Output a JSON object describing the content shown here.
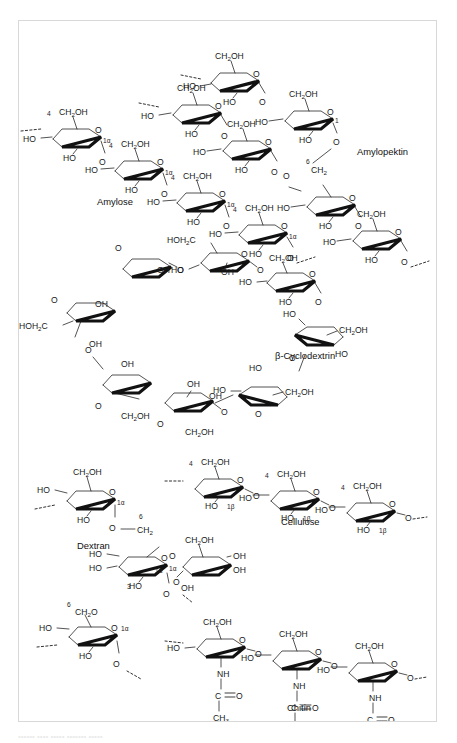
{
  "figure": {
    "background_color": "#ffffff",
    "border_color": "#d8d8d8",
    "ink_color": "#1a1a1a"
  },
  "structures": [
    {
      "id": "amylopektin",
      "name": "Amylopektin",
      "linkage_labels": [
        "6",
        "1"
      ],
      "branch_group": "CH2",
      "repeat_groups": [
        "CH2OH",
        "HO",
        "HO",
        "O"
      ]
    },
    {
      "id": "amylose",
      "name": "Amylose",
      "linkage_labels": [
        "4",
        "1α"
      ],
      "repeat_groups": [
        "CH2OH",
        "HO",
        "HO",
        "O"
      ]
    },
    {
      "id": "beta-cyclodextrin",
      "name": "β-Cyclodextrin",
      "ring_units": 7,
      "repeat_groups": [
        "HOH2C",
        "CH2OH",
        "OH",
        "HO",
        "O"
      ]
    },
    {
      "id": "cellulose",
      "name": "Cellulose",
      "linkage_labels": [
        "4",
        "1β"
      ],
      "repeat_groups": [
        "CH2OH",
        "HO",
        "O"
      ]
    },
    {
      "id": "dextran",
      "name": "Dextran",
      "linkage_labels": [
        "1α",
        "6",
        "3"
      ],
      "repeat_groups": [
        "CH2OH",
        "CH2",
        "HO",
        "OH",
        "O"
      ]
    },
    {
      "id": "chitin",
      "name": "Chitin",
      "linkage_labels": [],
      "repeat_groups": [
        "CH2OH",
        "HO",
        "NH",
        "C=O",
        "CH3",
        "O"
      ]
    }
  ],
  "chemical_labels": {
    "ch2oh": "CH",
    "ch2oh_sub": "2",
    "ch2oh_tail": "OH",
    "hoh2c_head": "HOH",
    "hoh2c_sub": "2",
    "hoh2c_tail": "C",
    "ch2": "CH",
    "ch2_sub": "2",
    "ch3": "CH",
    "ch3_sub": "3",
    "ho": "HO",
    "oh": "OH",
    "o": "O",
    "nh": "NH",
    "c": "C",
    "carbonyl_o": "O",
    "n1alpha": "1α",
    "n1beta": "1β",
    "n1": "1",
    "n3": "3",
    "n4": "4",
    "n6": "6"
  },
  "caption": {
    "clipped_line": "•••••• •••• ••••• ••••••• •••••"
  }
}
